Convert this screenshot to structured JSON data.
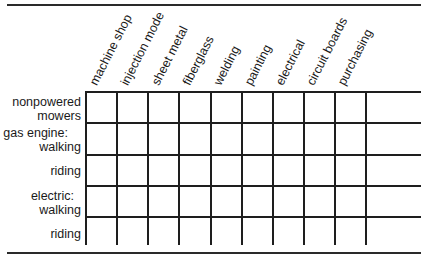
{
  "table": {
    "columns": [
      "machine shop",
      "injection mode",
      "sheet metal",
      "fiberglass",
      "welding",
      "painting",
      "electrical",
      "circuit boards",
      "purchasing",
      ""
    ],
    "rows": [
      {
        "line1": "nonpowered",
        "line2": "mowers"
      },
      {
        "line1": "gas engine:",
        "line2": "walking"
      },
      {
        "line1": "",
        "line2": "riding"
      },
      {
        "line1": "electric:",
        "line2": "walking"
      },
      {
        "line1": "",
        "line2": "riding"
      }
    ],
    "cells": [
      [
        "",
        "",
        "",
        "",
        "",
        "",
        "",
        "",
        "",
        ""
      ],
      [
        "",
        "",
        "",
        "",
        "",
        "",
        "",
        "",
        "",
        ""
      ],
      [
        "",
        "",
        "",
        "",
        "",
        "",
        "",
        "",
        "",
        ""
      ],
      [
        "",
        "",
        "",
        "",
        "",
        "",
        "",
        "",
        "",
        ""
      ],
      [
        "",
        "",
        "",
        "",
        "",
        "",
        "",
        "",
        "",
        ""
      ]
    ]
  }
}
